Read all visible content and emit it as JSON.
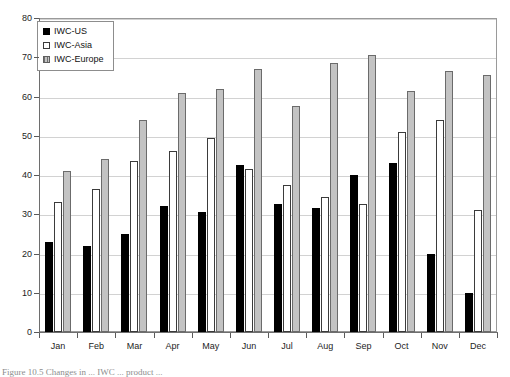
{
  "chart_data": {
    "type": "bar",
    "title": "",
    "xlabel": "",
    "ylabel": "",
    "ylim": [
      0,
      80
    ],
    "ytick_step": 10,
    "yticks": [
      0,
      10,
      20,
      30,
      40,
      50,
      60,
      70,
      80
    ],
    "grid": true,
    "legend_position": "top-left",
    "categories": [
      "Jan",
      "Feb",
      "Mar",
      "Apr",
      "May",
      "Jun",
      "Jul",
      "Aug",
      "Sep",
      "Oct",
      "Nov",
      "Dec"
    ],
    "series": [
      {
        "name": "IWC-US",
        "color": "#000000",
        "values": [
          23,
          22,
          25,
          32,
          30.5,
          42.5,
          32.5,
          31.5,
          40,
          43,
          20,
          10
        ]
      },
      {
        "name": "IWC-Asia",
        "color": "#ffffff",
        "values": [
          33,
          36.5,
          43.5,
          46,
          49.5,
          41.5,
          37.5,
          34.5,
          32.5,
          51,
          54,
          31
        ]
      },
      {
        "name": "IWC-Europe",
        "color": "#c3c3c3",
        "values": [
          41,
          44,
          54,
          61,
          62,
          67,
          57.5,
          68.5,
          70.5,
          61.5,
          66.5,
          65.5
        ]
      }
    ]
  },
  "legend": {
    "items": [
      {
        "label": "IWC-US"
      },
      {
        "label": "IWC-Asia"
      },
      {
        "label": "IWC-Europe"
      }
    ]
  },
  "caption": {
    "text": "Figure 10.5  Changes in ... IWC ... product ..."
  }
}
